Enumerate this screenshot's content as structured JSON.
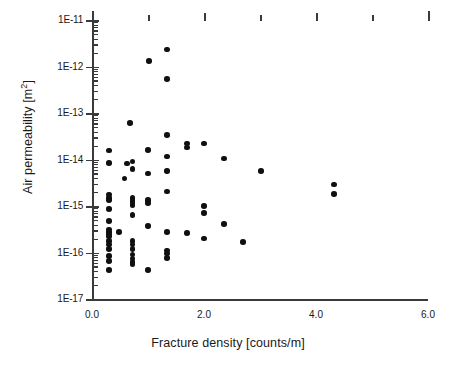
{
  "chart_data": {
    "type": "scatter",
    "title": "",
    "xlabel": "Fracture density [counts/m]",
    "ylabel": "Air permeability [m2]",
    "ylabel_base": "Air permeability [m",
    "ylabel_exponent": "2",
    "ylabel_suffix": "]",
    "xscale": "linear",
    "yscale": "log",
    "xlim": [
      0.0,
      6.0
    ],
    "ylim": [
      1e-17,
      1e-11
    ],
    "grid": false,
    "legend": null,
    "marker": "filled-circle",
    "marker_color": "#101010",
    "xticks": [
      0.0,
      2.0,
      4.0,
      6.0
    ],
    "xtick_labels": [
      "0.0",
      "2.0",
      "4.0",
      "6.0"
    ],
    "xminor_ticks": [
      1.0,
      3.0,
      5.0
    ],
    "yticks": [
      1e-11,
      1e-12,
      1e-13,
      1e-14,
      1e-15,
      1e-16,
      1e-17
    ],
    "ytick_labels": [
      "1E-11",
      "1E-12",
      "1E-13",
      "1E-14",
      "1E-15",
      "1E-16",
      "1E-17"
    ],
    "points": [
      {
        "x": 1.34,
        "y": 2.3e-12
      },
      {
        "x": 1.02,
        "y": 1.3e-12
      },
      {
        "x": 1.34,
        "y": 5.4e-13
      },
      {
        "x": 0.68,
        "y": 6.1e-14
      },
      {
        "x": 1.34,
        "y": 3.4e-14
      },
      {
        "x": 1.7,
        "y": 2.2e-14
      },
      {
        "x": 2.0,
        "y": 2.2e-14
      },
      {
        "x": 1.7,
        "y": 1.8e-14
      },
      {
        "x": 0.3,
        "y": 1.55e-14
      },
      {
        "x": 1.0,
        "y": 1.6e-14
      },
      {
        "x": 1.34,
        "y": 1.15e-14
      },
      {
        "x": 2.36,
        "y": 1.05e-14
      },
      {
        "x": 0.3,
        "y": 8.5e-15
      },
      {
        "x": 0.62,
        "y": 8.2e-15
      },
      {
        "x": 0.72,
        "y": 9e-15
      },
      {
        "x": 0.72,
        "y": 6.3e-15
      },
      {
        "x": 1.34,
        "y": 5.6e-15
      },
      {
        "x": 3.02,
        "y": 5.7e-15
      },
      {
        "x": 1.0,
        "y": 5e-15
      },
      {
        "x": 0.58,
        "y": 3.9e-15
      },
      {
        "x": 4.32,
        "y": 2.9e-15
      },
      {
        "x": 1.34,
        "y": 2.05e-15
      },
      {
        "x": 4.32,
        "y": 1.8e-15
      },
      {
        "x": 0.3,
        "y": 1.75e-15
      },
      {
        "x": 0.3,
        "y": 1.5e-15
      },
      {
        "x": 0.72,
        "y": 1.5e-15
      },
      {
        "x": 0.72,
        "y": 1.3e-15
      },
      {
        "x": 1.0,
        "y": 1.35e-15
      },
      {
        "x": 1.0,
        "y": 1.15e-15
      },
      {
        "x": 0.72,
        "y": 1.05e-15
      },
      {
        "x": 2.0,
        "y": 1e-15
      },
      {
        "x": 0.3,
        "y": 8.6e-16
      },
      {
        "x": 2.0,
        "y": 7.1e-16
      },
      {
        "x": 0.72,
        "y": 6.4e-16
      },
      {
        "x": 0.3,
        "y": 4.8e-16
      },
      {
        "x": 1.0,
        "y": 3.7e-16
      },
      {
        "x": 2.36,
        "y": 4.1e-16
      },
      {
        "x": 0.3,
        "y": 3.1e-16
      },
      {
        "x": 0.3,
        "y": 2.8e-16
      },
      {
        "x": 0.48,
        "y": 2.8e-16
      },
      {
        "x": 1.34,
        "y": 2.8e-16
      },
      {
        "x": 1.7,
        "y": 2.6e-16
      },
      {
        "x": 2.0,
        "y": 2e-16
      },
      {
        "x": 0.3,
        "y": 1.75e-16
      },
      {
        "x": 0.72,
        "y": 1.75e-16
      },
      {
        "x": 0.3,
        "y": 1.5e-16
      },
      {
        "x": 0.72,
        "y": 1.5e-16
      },
      {
        "x": 2.7,
        "y": 1.7e-16
      },
      {
        "x": 0.3,
        "y": 1.2e-16
      },
      {
        "x": 0.72,
        "y": 1.2e-16
      },
      {
        "x": 1.34,
        "y": 1.1e-16
      },
      {
        "x": 1.34,
        "y": 9.5e-17
      },
      {
        "x": 0.3,
        "y": 8.5e-17
      },
      {
        "x": 0.72,
        "y": 9e-17
      },
      {
        "x": 0.72,
        "y": 7.5e-17
      },
      {
        "x": 1.34,
        "y": 7.6e-17
      },
      {
        "x": 0.3,
        "y": 6.5e-17
      },
      {
        "x": 0.72,
        "y": 6.3e-17
      },
      {
        "x": 0.72,
        "y": 5.6e-17
      },
      {
        "x": 0.3,
        "y": 4.2e-17
      },
      {
        "x": 1.0,
        "y": 4.2e-17
      },
      {
        "x": 0.3,
        "y": 2.2e-16
      },
      {
        "x": 0.3,
        "y": 1.35e-15
      },
      {
        "x": 0.72,
        "y": 1.2e-15
      },
      {
        "x": 0.3,
        "y": 2.45e-16
      }
    ]
  }
}
